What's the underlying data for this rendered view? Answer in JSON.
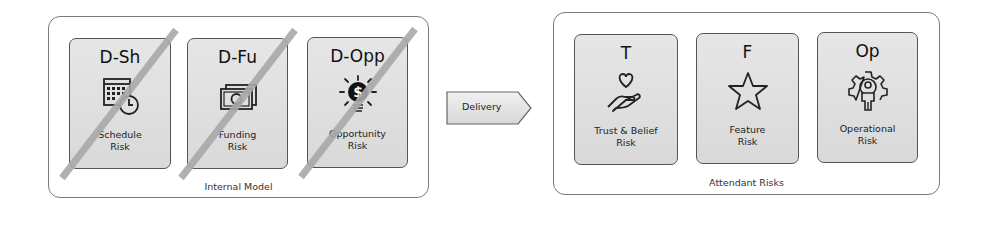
{
  "left_group": {
    "caption": "Internal Model",
    "cards": [
      {
        "code": "D-Sh",
        "label_line1": "Schedule",
        "label_line2": "Risk",
        "icon": "calendar-clock-icon",
        "struck_out": true
      },
      {
        "code": "D-Fu",
        "label_line1": "Funding",
        "label_line2": "Risk",
        "icon": "banknote-icon",
        "struck_out": true
      },
      {
        "code": "D-Opp",
        "label_line1": "Opportunity",
        "label_line2": "Risk",
        "icon": "lightbulb-dollar-icon",
        "struck_out": true
      }
    ]
  },
  "connector": {
    "label": "Delivery",
    "icon": "arrow-pentagon-icon"
  },
  "right_group": {
    "caption": "Attendant Risks",
    "cards": [
      {
        "code": "T",
        "label_line1": "Trust & Belief",
        "label_line2": "Risk",
        "icon": "hand-heart-icon",
        "struck_out": false
      },
      {
        "code": "F",
        "label_line1": "Feature",
        "label_line2": "Risk",
        "icon": "star-icon",
        "struck_out": false
      },
      {
        "code": "Op",
        "label_line1": "Operational",
        "label_line2": "Risk",
        "icon": "gear-person-icon",
        "struck_out": false
      }
    ]
  },
  "colors": {
    "strike": "#a9a9a9",
    "card_border": "#555555",
    "group_border": "#7a7a7a"
  }
}
